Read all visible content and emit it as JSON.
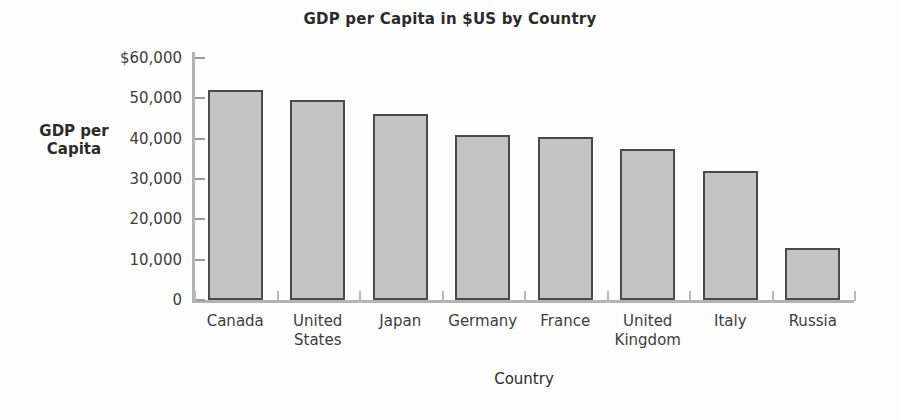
{
  "chart_data": {
    "type": "bar",
    "title": "GDP per Capita in $US by Country",
    "xlabel": "Country",
    "ylabel": "GDP per Capita",
    "ylabel_lines": [
      "GDP",
      "per",
      "Capita"
    ],
    "categories": [
      "Canada",
      "United States",
      "Japan",
      "Germany",
      "France",
      "United Kingdom",
      "Italy",
      "Russia"
    ],
    "category_lines": [
      [
        "Canada"
      ],
      [
        "United",
        "States"
      ],
      [
        "Japan"
      ],
      [
        "Germany"
      ],
      [
        "France"
      ],
      [
        "United",
        "Kingdom"
      ],
      [
        "Italy"
      ],
      [
        "Russia"
      ]
    ],
    "values": [
      52000,
      49500,
      46000,
      41000,
      40500,
      37500,
      32000,
      13000
    ],
    "ylim": [
      0,
      60000
    ],
    "ytick_values": [
      60000,
      50000,
      40000,
      30000,
      20000,
      10000,
      0
    ],
    "ytick_labels": [
      "$60,000",
      "50,000",
      "40,000",
      "30,000",
      "20,000",
      "10,000",
      "0"
    ],
    "grid": false,
    "legend": false,
    "bar_fill_color": "#c4c4c4",
    "bar_edge_color": "#4a4a4a",
    "axis_color": "#b3b3b3",
    "text_color": "#3d3d3d",
    "background_color": "#fdfdfd"
  }
}
